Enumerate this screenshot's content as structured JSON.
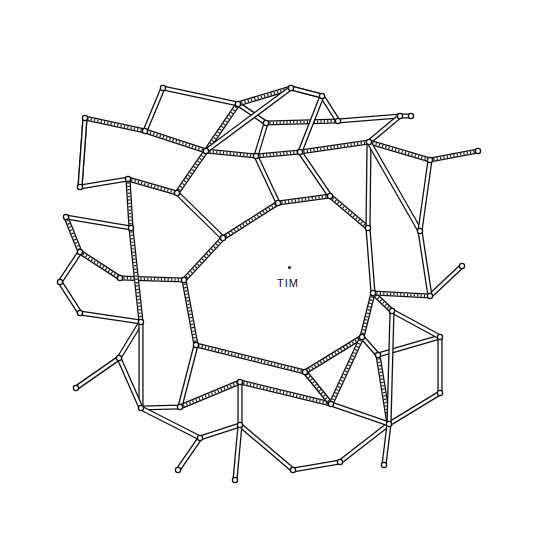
{
  "figure": {
    "center_label": "TIM",
    "center_marker": "dot",
    "colors": {
      "ink": "#111111",
      "paper": "#ffffff"
    }
  },
  "nodes": [
    {
      "id": "c1",
      "x": 223,
      "y": 238
    },
    {
      "id": "c2",
      "x": 278,
      "y": 203
    },
    {
      "id": "c3",
      "x": 330,
      "y": 196
    },
    {
      "id": "c4",
      "x": 368,
      "y": 228
    },
    {
      "id": "c5",
      "x": 373,
      "y": 293
    },
    {
      "id": "c6",
      "x": 362,
      "y": 337
    },
    {
      "id": "c7",
      "x": 305,
      "y": 372
    },
    {
      "id": "c8",
      "x": 196,
      "y": 345
    },
    {
      "id": "c9",
      "x": 184,
      "y": 280
    },
    {
      "id": "a1",
      "x": 145,
      "y": 131
    },
    {
      "id": "a2",
      "x": 206,
      "y": 151
    },
    {
      "id": "a3",
      "x": 256,
      "y": 156
    },
    {
      "id": "a4",
      "x": 300,
      "y": 152
    },
    {
      "id": "a5",
      "x": 369,
      "y": 142
    },
    {
      "id": "a6",
      "x": 338,
      "y": 121
    },
    {
      "id": "a7",
      "x": 266,
      "y": 123
    },
    {
      "id": "a8",
      "x": 238,
      "y": 104
    },
    {
      "id": "a9",
      "x": 291,
      "y": 88
    },
    {
      "id": "a10",
      "x": 322,
      "y": 96
    },
    {
      "id": "a11",
      "x": 400,
      "y": 116
    },
    {
      "id": "a12",
      "x": 430,
      "y": 160
    },
    {
      "id": "a13",
      "x": 478,
      "y": 151
    },
    {
      "id": "a14",
      "x": 163,
      "y": 88
    },
    {
      "id": "a15",
      "x": 85,
      "y": 118
    },
    {
      "id": "a16",
      "x": 80,
      "y": 187
    },
    {
      "id": "a17",
      "x": 128,
      "y": 179
    },
    {
      "id": "a18",
      "x": 177,
      "y": 193
    },
    {
      "id": "a19",
      "x": 411,
      "y": 116
    },
    {
      "id": "a20",
      "x": 420,
      "y": 231
    },
    {
      "id": "a21",
      "x": 430,
      "y": 296
    },
    {
      "id": "b1",
      "x": 66,
      "y": 217
    },
    {
      "id": "b2",
      "x": 131,
      "y": 228
    },
    {
      "id": "b3",
      "x": 80,
      "y": 252
    },
    {
      "id": "b4",
      "x": 120,
      "y": 278
    },
    {
      "id": "b5",
      "x": 60,
      "y": 282
    },
    {
      "id": "b6",
      "x": 80,
      "y": 313
    },
    {
      "id": "b7",
      "x": 141,
      "y": 322
    },
    {
      "id": "b8",
      "x": 119,
      "y": 358
    },
    {
      "id": "b9",
      "x": 76,
      "y": 388
    },
    {
      "id": "b10",
      "x": 141,
      "y": 408
    },
    {
      "id": "b11",
      "x": 180,
      "y": 407
    },
    {
      "id": "b12",
      "x": 240,
      "y": 382
    },
    {
      "id": "b13",
      "x": 200,
      "y": 438
    },
    {
      "id": "b14",
      "x": 240,
      "y": 425
    },
    {
      "id": "b15",
      "x": 178,
      "y": 470
    },
    {
      "id": "b16",
      "x": 235,
      "y": 480
    },
    {
      "id": "b17",
      "x": 331,
      "y": 404
    },
    {
      "id": "b18",
      "x": 392,
      "y": 311
    },
    {
      "id": "b19",
      "x": 378,
      "y": 355
    },
    {
      "id": "b20",
      "x": 440,
      "y": 337
    },
    {
      "id": "b21",
      "x": 440,
      "y": 393
    },
    {
      "id": "b22",
      "x": 389,
      "y": 424
    },
    {
      "id": "b23",
      "x": 340,
      "y": 462
    },
    {
      "id": "b24",
      "x": 293,
      "y": 470
    },
    {
      "id": "b25",
      "x": 384,
      "y": 465
    },
    {
      "id": "b26",
      "x": 462,
      "y": 266
    }
  ],
  "edges_note": "Edges rendered as double lines; a subset are hatched (heavier stroke)"
}
